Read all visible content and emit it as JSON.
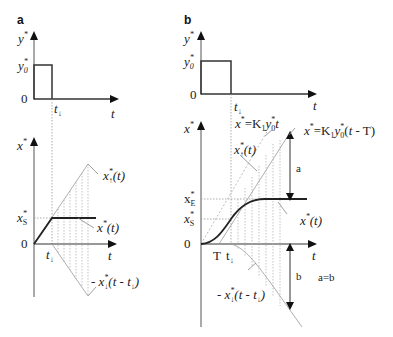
{
  "panels": {
    "a": {
      "label": "a",
      "top_plot": {
        "y_axis_label": "y*",
        "y_level_label": "y*0",
        "zero_label": "0",
        "time_marker_label": "t↓",
        "x_axis_label": "t"
      },
      "bottom_plot": {
        "y_axis_label": "x*",
        "level_label": "x*S",
        "zero_label": "0",
        "time_marker_label": "t↓",
        "x_axis_label": "t",
        "curve_labels": {
          "ramp_up": "x*↑(t)",
          "response": "x*(t)",
          "ramp_down": "- x*↓(t - t↓)"
        }
      }
    },
    "b": {
      "label": "b",
      "top_plot": {
        "y_axis_label": "y*",
        "y_level_label": "y*0",
        "zero_label": "0",
        "time_marker_label": "t↓",
        "x_axis_label": "t"
      },
      "bottom_plot": {
        "y_axis_label": "x*",
        "level_labels": [
          "x*E",
          "x*S"
        ],
        "zero_label": "0",
        "delay_label": "T",
        "time_marker_label": "t↓",
        "x_axis_label": "t",
        "curve_labels": {
          "ideal_ramp": "x* =K1y*0t",
          "delayed_ramp": "x* =K1y*0(t - T)",
          "ramp_up": "x*↑(t)",
          "response": "x*(t)",
          "ramp_down": "- x*↓(t - t↓)"
        },
        "annotations": {
          "a": "a",
          "b": "b",
          "equality": "a=b"
        }
      }
    }
  }
}
